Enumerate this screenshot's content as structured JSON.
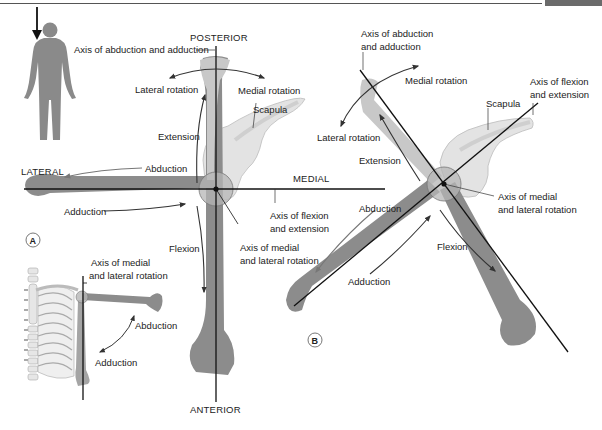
{
  "figure": {
    "panel_a": {
      "id": "A",
      "directions": {
        "top": "POSTERIOR",
        "bottom": "ANTERIOR",
        "left": "LATERAL",
        "right": "MEDIAL"
      },
      "labels": {
        "axis_abduction_adduction": "Axis of abduction and adduction",
        "lateral_rotation": "Lateral rotation",
        "medial_rotation": "Medial rotation",
        "scapula": "Scapula",
        "extension": "Extension",
        "abduction": "Abduction",
        "adduction": "Adduction",
        "flexion": "Flexion",
        "axis_flexion_extension_1": "Axis of flexion",
        "axis_flexion_extension_2": "and extension",
        "axis_medial_lateral_1": "Axis of medial",
        "axis_medial_lateral_2": "and lateral rotation"
      },
      "inset": {
        "axis_medial_lateral_1": "Axis of medial",
        "axis_medial_lateral_2": "and lateral rotation",
        "abduction": "Abduction",
        "adduction": "Adduction"
      }
    },
    "panel_b": {
      "id": "B",
      "labels": {
        "axis_abduction_adduction_1": "Axis of abduction",
        "axis_abduction_adduction_2": "and adduction",
        "medial_rotation": "Medial rotation",
        "axis_flexion_extension_1": "Axis of flexion",
        "axis_flexion_extension_2": "and extension",
        "scapula": "Scapula",
        "lateral_rotation": "Lateral rotation",
        "extension": "Extension",
        "axis_medial_lateral_1": "Axis of medial",
        "axis_medial_lateral_2": "and lateral rotation",
        "abduction": "Abduction",
        "flexion": "Flexion",
        "adduction": "Adduction"
      }
    },
    "colors": {
      "bone_dark": "#8c8c8c",
      "bone_light": "#c8c8c8",
      "scapula": "#e3e3e3",
      "joint": "#b5b5b5",
      "axis_line": "#111111",
      "arrow": "#333333",
      "figure_silhouette": "#8a8a8a",
      "header_bar": "#6b6b6b"
    }
  }
}
